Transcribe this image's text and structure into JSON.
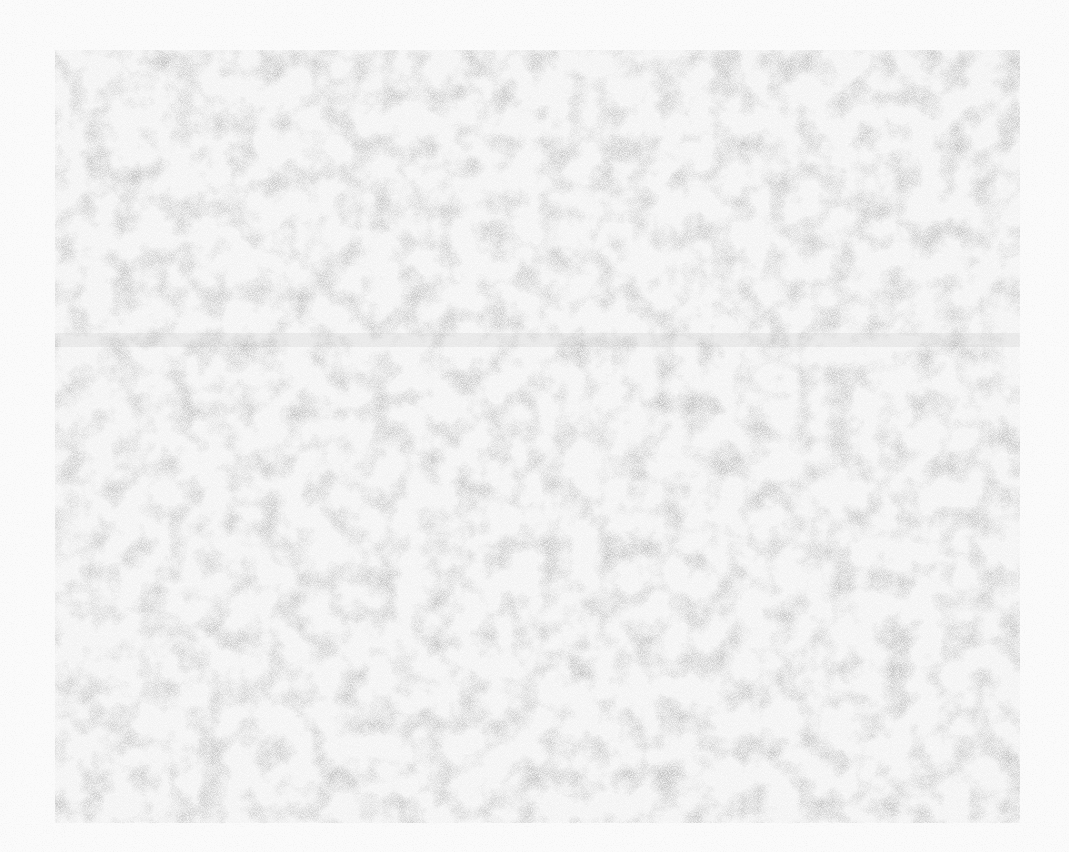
{
  "scene": {
    "description": "Noisy gray textured rectangle on a near-white background; no text or UI elements visible",
    "background_color": "#fbfbfb",
    "panel": {
      "x": 55,
      "y": 50,
      "width": 965,
      "height": 773,
      "base_color": "#e9e9e9",
      "texture": "mottled-noise"
    },
    "band": {
      "y": 333,
      "height": 14
    }
  }
}
